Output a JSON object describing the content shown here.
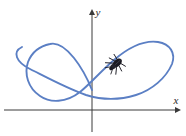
{
  "figure": {
    "name": "parametric-curve-with-bug",
    "background_color": "#ffffff",
    "width": 186,
    "height": 136
  },
  "axes": {
    "x_axis": {
      "label": "x",
      "label_position": {
        "x": 176,
        "y": 104
      },
      "color": "#3a3a3a",
      "start": {
        "x": 4,
        "y": 110
      },
      "end": {
        "x": 178,
        "y": 110
      },
      "arrow": "right"
    },
    "y_axis": {
      "label": "y",
      "label_position": {
        "x": 98,
        "y": 16
      },
      "color": "#3a3a3a",
      "start": {
        "x": 92,
        "y": 132
      },
      "end": {
        "x": 92,
        "y": 12
      },
      "arrow": "up"
    },
    "origin": {
      "x": 92,
      "y": 110
    }
  },
  "chart_data": {
    "type": "line",
    "title": "",
    "xlabel": "x",
    "ylabel": "y",
    "grid": false,
    "legend": null,
    "curve": {
      "name": "self-intersecting-parametric-curve",
      "color": "#5b7fc4",
      "stroke_width": 1.9,
      "closed": true,
      "description": "A smooth closed self-intersecting curve with a narrow elongated loop at upper left and a large rounded loop at right; the two branches cross just left of the y-axis above the x-axis.",
      "path": "M 22 47 C 12 52 16 62 30 69 C 46 77 66 88 86 95 C 102 100 120 100 136 95 C 152 90 166 78 172 64 C 176 53 170 44 158 42 C 144 40 128 48 114 60 C 100 72 90 84 80 92 C 66 103 50 103 40 96 C 28 88 24 74 28 62 C 32 52 40 46 50 44 C 58 42 66 48 74 58 C 82 68 88 80 92 90",
      "self_intersection": {
        "x": 88,
        "y": 94
      }
    },
    "marker": {
      "name": "bug",
      "label": "bug",
      "color": "#1a1a22",
      "position": {
        "x": 116,
        "y": 64
      },
      "rotation_deg": -42,
      "body_length": 13,
      "body_width": 7
    }
  }
}
